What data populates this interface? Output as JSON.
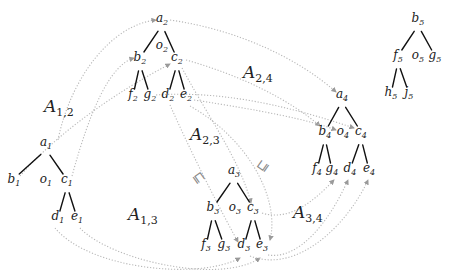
{
  "diagram": {
    "type": "tree-morphism-diagram",
    "colors": {
      "edge": "#111111",
      "morphism": "#b8b8b8",
      "text": "#1a1a1a",
      "background": "#ffffff"
    },
    "trees": [
      {
        "id": "tree1",
        "nodes": [
          {
            "id": "a1",
            "base": "a",
            "sub": "1",
            "x": 46,
            "y": 146
          },
          {
            "id": "b1",
            "base": "b",
            "sub": "1",
            "x": 14,
            "y": 183
          },
          {
            "id": "o1",
            "base": "o",
            "sub": "1",
            "x": 46,
            "y": 183
          },
          {
            "id": "c1",
            "base": "c",
            "sub": "1",
            "x": 67,
            "y": 183
          },
          {
            "id": "d1",
            "base": "d",
            "sub": "1",
            "x": 58,
            "y": 220
          },
          {
            "id": "e1",
            "base": "e",
            "sub": "1",
            "x": 77,
            "y": 220
          }
        ],
        "edges": [
          [
            "a1",
            "b1"
          ],
          [
            "a1",
            "c1"
          ],
          [
            "c1",
            "d1"
          ],
          [
            "c1",
            "e1"
          ]
        ]
      },
      {
        "id": "tree2",
        "nodes": [
          {
            "id": "a2",
            "base": "a",
            "sub": "2",
            "x": 162,
            "y": 22
          },
          {
            "id": "o2",
            "base": "o",
            "sub": "2",
            "x": 162,
            "y": 49
          },
          {
            "id": "b2",
            "base": "b",
            "sub": "2",
            "x": 140,
            "y": 61
          },
          {
            "id": "c2",
            "base": "c",
            "sub": "2",
            "x": 177,
            "y": 61
          },
          {
            "id": "f2",
            "base": "f",
            "sub": "2",
            "x": 133,
            "y": 98
          },
          {
            "id": "g2",
            "base": "g",
            "sub": "2",
            "x": 150,
            "y": 98
          },
          {
            "id": "d2",
            "base": "d",
            "sub": "2",
            "x": 168,
            "y": 98
          },
          {
            "id": "e2",
            "base": "e",
            "sub": "2",
            "x": 186,
            "y": 98
          }
        ],
        "edges": [
          [
            "a2",
            "b2"
          ],
          [
            "a2",
            "c2"
          ],
          [
            "b2",
            "f2"
          ],
          [
            "b2",
            "g2"
          ],
          [
            "c2",
            "d2"
          ],
          [
            "c2",
            "e2"
          ]
        ]
      },
      {
        "id": "tree3",
        "nodes": [
          {
            "id": "a3",
            "base": "a",
            "sub": "3",
            "x": 234,
            "y": 174
          },
          {
            "id": "b3",
            "base": "b",
            "sub": "3",
            "x": 213,
            "y": 211
          },
          {
            "id": "o3",
            "base": "o",
            "sub": "3",
            "x": 235,
            "y": 211
          },
          {
            "id": "c3",
            "base": "c",
            "sub": "3",
            "x": 253,
            "y": 211
          },
          {
            "id": "f3",
            "base": "f",
            "sub": "3",
            "x": 206,
            "y": 248
          },
          {
            "id": "g3",
            "base": "g",
            "sub": "3",
            "x": 224,
            "y": 248
          },
          {
            "id": "d3",
            "base": "d",
            "sub": "3",
            "x": 244,
            "y": 248
          },
          {
            "id": "e3",
            "base": "e",
            "sub": "3",
            "x": 262,
            "y": 248
          }
        ],
        "edges": [
          [
            "a3",
            "b3"
          ],
          [
            "a3",
            "c3"
          ],
          [
            "b3",
            "f3"
          ],
          [
            "b3",
            "g3"
          ],
          [
            "c3",
            "d3"
          ],
          [
            "c3",
            "e3"
          ]
        ]
      },
      {
        "id": "tree4",
        "nodes": [
          {
            "id": "a4",
            "base": "a",
            "sub": "4",
            "x": 342,
            "y": 98
          },
          {
            "id": "b4",
            "base": "b",
            "sub": "4",
            "x": 325,
            "y": 135
          },
          {
            "id": "o4",
            "base": "o",
            "sub": "4",
            "x": 343,
            "y": 135
          },
          {
            "id": "c4",
            "base": "c",
            "sub": "4",
            "x": 361,
            "y": 135
          },
          {
            "id": "f4",
            "base": "f",
            "sub": "4",
            "x": 317,
            "y": 172
          },
          {
            "id": "g4",
            "base": "g",
            "sub": "4",
            "x": 332,
            "y": 172
          },
          {
            "id": "d4",
            "base": "d",
            "sub": "4",
            "x": 350,
            "y": 172
          },
          {
            "id": "e4",
            "base": "e",
            "sub": "4",
            "x": 369,
            "y": 172
          }
        ],
        "edges": [
          [
            "a4",
            "b4"
          ],
          [
            "a4",
            "c4"
          ],
          [
            "b4",
            "f4"
          ],
          [
            "b4",
            "g4"
          ],
          [
            "c4",
            "d4"
          ],
          [
            "c4",
            "e4"
          ]
        ]
      },
      {
        "id": "tree5",
        "nodes": [
          {
            "id": "b5",
            "base": "b",
            "sub": "5",
            "x": 418,
            "y": 22
          },
          {
            "id": "f5",
            "base": "f",
            "sub": "5",
            "x": 398,
            "y": 59
          },
          {
            "id": "o5",
            "base": "o",
            "sub": "5",
            "x": 418,
            "y": 59
          },
          {
            "id": "g5",
            "base": "g",
            "sub": "5",
            "x": 435,
            "y": 59
          },
          {
            "id": "h5",
            "base": "h",
            "sub": "5",
            "x": 391,
            "y": 96
          },
          {
            "id": "j5",
            "base": "j",
            "sub": "5",
            "x": 409,
            "y": 96
          }
        ],
        "edges": [
          [
            "b5",
            "f5"
          ],
          [
            "b5",
            "g5"
          ],
          [
            "f5",
            "h5"
          ],
          [
            "f5",
            "j5"
          ]
        ]
      }
    ],
    "morphism_labels": [
      {
        "id": "A12",
        "base": "A",
        "sub": "1,2",
        "x": 44,
        "y": 112
      },
      {
        "id": "A24",
        "base": "A",
        "sub": "2,4",
        "x": 243,
        "y": 78
      },
      {
        "id": "A23",
        "base": "A",
        "sub": "2,3",
        "x": 190,
        "y": 140
      },
      {
        "id": "A13",
        "base": "A",
        "sub": "1,3",
        "x": 128,
        "y": 220
      },
      {
        "id": "A34",
        "base": "A",
        "sub": "3,4",
        "x": 293,
        "y": 218
      }
    ],
    "ordering_symbols": [
      {
        "id": "sq1",
        "glyph": "⊑",
        "x": 196,
        "y": 180,
        "rotate": 55
      },
      {
        "id": "sq2",
        "glyph": "⊑",
        "x": 266,
        "y": 168,
        "rotate": -55
      }
    ],
    "morphisms": [
      {
        "from": "a1",
        "to": "a2",
        "path": "M58,140 C70,80 110,25 156,20"
      },
      {
        "from": "c1",
        "to": "b2",
        "path": "M72,176 C90,110 110,65 134,58"
      },
      {
        "from": "b1",
        "to": "c2",
        "path": "M20,176 C60,130 120,90 170,64"
      },
      {
        "from": "a2",
        "to": "a4",
        "path": "M170,20 C240,30 300,60 336,92"
      },
      {
        "from": "c2",
        "to": "b4",
        "path": "M186,60 C240,75 290,100 320,126"
      },
      {
        "from": "g2",
        "to": "c4",
        "path": "M156,95 C230,90 300,110 354,128"
      },
      {
        "from": "e2",
        "to": "o4",
        "path": "M194,100 C260,110 310,120 336,130"
      },
      {
        "from": "d2",
        "to": "d3",
        "path": "M170,105 C190,150 215,200 238,242"
      },
      {
        "from": "c2",
        "to": "c3",
        "path": "M182,68 C210,120 240,160 251,203"
      },
      {
        "from": "e2",
        "to": "e3",
        "path": "M190,106 C250,140 280,200 270,240"
      },
      {
        "from": "d1",
        "to": "d3",
        "path": "M55,228 C90,270 200,280 240,258"
      },
      {
        "from": "e1",
        "to": "e3",
        "path": "M80,228 C110,260 220,285 260,258"
      },
      {
        "from": "c3",
        "to": "g4",
        "path": "M262,213 C290,222 315,200 334,180"
      },
      {
        "from": "e3",
        "to": "d4",
        "path": "M268,255 C300,260 330,220 348,180"
      },
      {
        "from": "d3",
        "to": "e4",
        "path": "M250,256 C300,275 350,220 368,180"
      }
    ]
  }
}
